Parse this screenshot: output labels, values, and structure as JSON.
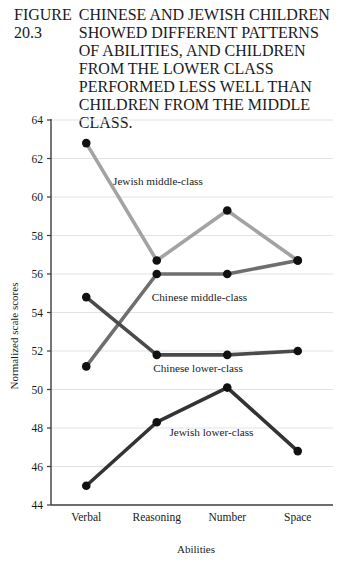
{
  "figure": {
    "number": "FIGURE 20.3",
    "caption": "CHINESE AND JEWISH CHILDREN SHOWED DIFFERENT PATTERNS OF ABILITIES, AND CHILDREN FROM THE LOWER CLASS PERFORMED LESS WELL THAN CHILDREN FROM THE MIDDLE CLASS."
  },
  "chart_data": {
    "type": "line",
    "title": "",
    "xlabel": "Abilities",
    "ylabel": "Normalized scale scores",
    "categories": [
      "Verbal",
      "Reasoning",
      "Number",
      "Space"
    ],
    "ylim": [
      44,
      64
    ],
    "yticks": [
      44,
      46,
      48,
      50,
      52,
      54,
      56,
      58,
      60,
      62,
      64
    ],
    "grid": true,
    "legend": "inline-annotations",
    "series": [
      {
        "name": "Jewish middle-class",
        "color": "#a3a3a3",
        "values": [
          62.8,
          56.7,
          59.3,
          56.7
        ],
        "label_x": 0.38,
        "label_y": 60.6
      },
      {
        "name": "Chinese middle-class",
        "color": "#6e6e6e",
        "values": [
          51.2,
          56.0,
          56.0,
          56.7
        ],
        "label_x": 0.93,
        "label_y": 54.6
      },
      {
        "name": "Chinese lower-class",
        "color": "#4a4a4a",
        "values": [
          54.8,
          51.8,
          51.8,
          52.0
        ],
        "label_x": 0.95,
        "label_y": 50.9
      },
      {
        "name": "Jewish lower-class",
        "color": "#333333",
        "values": [
          45.0,
          48.3,
          50.1,
          46.8
        ],
        "label_x": 1.18,
        "label_y": 47.6
      }
    ]
  }
}
